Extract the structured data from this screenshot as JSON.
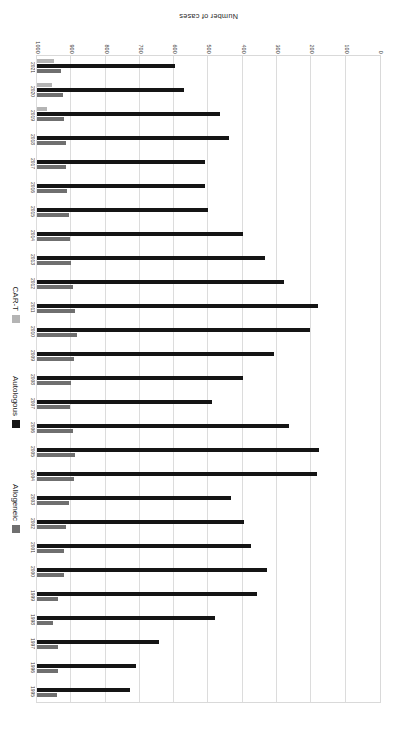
{
  "chart_data": {
    "type": "bar",
    "orientation": "horizontal",
    "title": "",
    "xlabel": "Number of cases",
    "ylabel": "",
    "xlim": [
      0,
      1000
    ],
    "xticks": [
      0,
      100,
      200,
      300,
      400,
      500,
      600,
      700,
      800,
      900,
      1000
    ],
    "grid": true,
    "legend_position": "right",
    "categories": [
      "1995",
      "1996",
      "1997",
      "1998",
      "1999",
      "2000",
      "2001",
      "2002",
      "2003",
      "2004",
      "2005",
      "2006",
      "2007",
      "2008",
      "2009",
      "2010",
      "2011",
      "2012",
      "2013",
      "2014",
      "2015",
      "2016",
      "2017",
      "2018",
      "2019",
      "2020",
      "2021"
    ],
    "series": [
      {
        "name": "Allogeneic",
        "color": "#6f6f6f",
        "values": [
          57,
          60,
          62,
          47,
          62,
          78,
          80,
          85,
          92,
          108,
          112,
          104,
          96,
          100,
          108,
          118,
          112,
          104,
          100,
          95,
          92,
          88,
          86,
          84,
          80,
          76,
          70
        ]
      },
      {
        "name": "Autologous",
        "color": "#151515",
        "values": [
          270,
          290,
          355,
          520,
          640,
          670,
          625,
          605,
          565,
          815,
          822,
          735,
          510,
          600,
          690,
          795,
          820,
          720,
          665,
          600,
          500,
          490,
          490,
          560,
          535,
          430,
          403
        ]
      },
      {
        "name": "CAR-T",
        "color": "#b4b4b4",
        "values": [
          0,
          0,
          0,
          0,
          0,
          0,
          0,
          0,
          0,
          0,
          0,
          0,
          0,
          0,
          0,
          0,
          0,
          0,
          0,
          0,
          0,
          0,
          0,
          0,
          28,
          44,
          50
        ]
      }
    ]
  },
  "axis": {
    "title": "Number of cases"
  },
  "legend": {
    "items": [
      {
        "label": "Allogeneic",
        "color": "#6f6f6f"
      },
      {
        "label": "Autologous",
        "color": "#151515"
      },
      {
        "label": "CAR-T",
        "color": "#b4b4b4"
      }
    ]
  }
}
